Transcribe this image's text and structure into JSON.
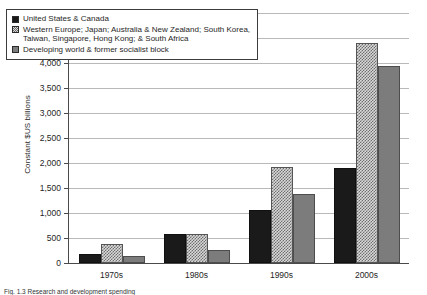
{
  "chart_data": {
    "type": "bar",
    "title": "",
    "xlabel": "",
    "ylabel": "Constant $US billions",
    "categories": [
      "1970s",
      "1980s",
      "1990s",
      "2000s"
    ],
    "series": [
      {
        "name": "United States & Canada",
        "values": [
          190,
          580,
          1070,
          1900
        ],
        "color": "#1a1a1a",
        "fill": "solid-black"
      },
      {
        "name": "Western Europe; Japan; Australia & New Zealand; South Korea, Taiwan, Singapore, Hong Kong; & South Africa",
        "name_line1": "Western Europe; Japan; Australia & New Zealand; South Korea,",
        "name_line2": "Taiwan, Singapore, Hong Kong; & South Africa",
        "values": [
          380,
          580,
          1930,
          4400
        ],
        "color": "#d8d8d8",
        "fill": "checkered"
      },
      {
        "name": "Developing world & former socialist block",
        "values": [
          140,
          260,
          1390,
          3950
        ],
        "color": "#7c7c7c",
        "fill": "solid-gray"
      }
    ],
    "ylim": [
      0,
      5000
    ],
    "ytick_values": [
      0,
      500,
      1000,
      1500,
      2000,
      2500,
      3000,
      3500,
      4000,
      4500,
      5000
    ],
    "ytick_labels": [
      "0",
      "500",
      "1,000",
      "1,500",
      "2,000",
      "2,500",
      "3,000",
      "3,500",
      "4,000",
      "4,500",
      "5,000"
    ],
    "grid": "horizontal",
    "legend_position": "upper-left-inside"
  },
  "caption": {
    "text": "Fig. 1.3 Research and development spending"
  }
}
